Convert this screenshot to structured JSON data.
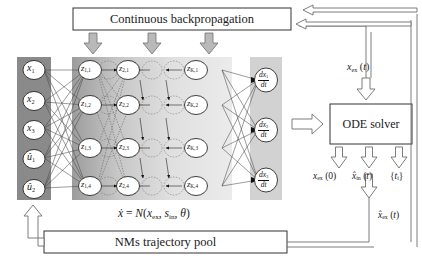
{
  "diagram": {
    "title_box": {
      "label": "Continuous backpropagation"
    },
    "pool_box": {
      "label": "NMs trajectory pool"
    },
    "solver_box": {
      "label": "ODE solver"
    },
    "equation": {
      "text": "ẋ = N(xex, sin, θ)"
    }
  },
  "network": {
    "input_layer": {
      "name": "input-layer",
      "nodes": [
        {
          "id": "x1",
          "base": "x",
          "sub": "1",
          "hat": false
        },
        {
          "id": "x2",
          "base": "x",
          "sub": "2",
          "hat": false
        },
        {
          "id": "x3",
          "base": "x",
          "sub": "3",
          "hat": false
        },
        {
          "id": "u1",
          "base": "u",
          "sub": "1",
          "hat": true
        },
        {
          "id": "u2",
          "base": "u",
          "sub": "2",
          "hat": true
        }
      ]
    },
    "hidden_layers": [
      {
        "name": "hidden-layer-1",
        "nodes": [
          {
            "id": "z11",
            "base": "z",
            "sub": "1,1"
          },
          {
            "id": "z12",
            "base": "z",
            "sub": "1,2"
          },
          {
            "id": "z13",
            "base": "z",
            "sub": "1,3"
          },
          {
            "id": "z14",
            "base": "z",
            "sub": "1,4"
          }
        ]
      },
      {
        "name": "hidden-layer-2",
        "nodes": [
          {
            "id": "z21",
            "base": "z",
            "sub": "2,1"
          },
          {
            "id": "z22",
            "base": "z",
            "sub": "2,2"
          },
          {
            "id": "z23",
            "base": "z",
            "sub": "2,3"
          },
          {
            "id": "z24",
            "base": "z",
            "sub": "2,4"
          }
        ]
      },
      {
        "name": "hidden-layer-k",
        "nodes": [
          {
            "id": "zK1",
            "base": "z",
            "sub": "K,1"
          },
          {
            "id": "zK2",
            "base": "z",
            "sub": "K,2"
          },
          {
            "id": "zK3",
            "base": "z",
            "sub": "K,3"
          },
          {
            "id": "zK4",
            "base": "z",
            "sub": "K,4"
          }
        ]
      }
    ],
    "output_layer": {
      "name": "output-layer",
      "nodes": [
        {
          "id": "dx1dt",
          "num": "dx1",
          "den": "dt"
        },
        {
          "id": "dx2dt",
          "num": "dx2",
          "den": "dt"
        },
        {
          "id": "dx3dt",
          "num": "dx3",
          "den": "dt"
        }
      ]
    }
  },
  "signals": {
    "x_ex_t": "xex (t)",
    "x_ex_0": "xex (0)",
    "x_in_hat_t": "x̂in (t)",
    "t_set": "{ti}",
    "x_ex_hat_t": "x̂ex (t)"
  },
  "colors": {
    "input_band": "#8a8a8a",
    "hidden_band_dark": "#9a9a9a",
    "hidden_band_light": "#e3e3e3",
    "output_band": "#d2d2d2",
    "arrow_fill": "#b9b9b9",
    "arrow_stroke": "#6e6e6e",
    "node_fill": "#ffffff",
    "line": "#3a3a3a",
    "box_stroke": "#333333",
    "background": "#ffffff"
  }
}
